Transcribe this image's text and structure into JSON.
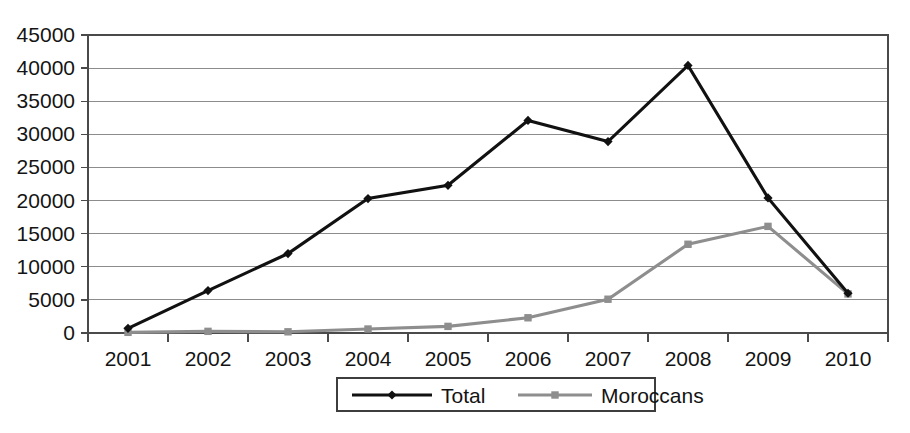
{
  "chart_data": {
    "type": "line",
    "title": "",
    "subtitle": "",
    "xlabel": "",
    "ylabel": "",
    "categories": [
      "2001",
      "2002",
      "2003",
      "2004",
      "2005",
      "2006",
      "2007",
      "2008",
      "2009",
      "2010"
    ],
    "series": [
      {
        "name": "Total",
        "color": "#111111",
        "marker": "diamond",
        "values": [
          700,
          6400,
          12000,
          20300,
          22300,
          32100,
          28900,
          40400,
          20400,
          6000
        ]
      },
      {
        "name": "Moroccans",
        "color": "#8e8e8e",
        "marker": "square",
        "values": [
          100,
          250,
          180,
          600,
          1000,
          2300,
          5100,
          13400,
          16100,
          5900
        ]
      }
    ],
    "ylim": [
      0,
      45000
    ],
    "yticks": [
      0,
      5000,
      10000,
      15000,
      20000,
      25000,
      30000,
      35000,
      40000,
      45000
    ],
    "ytick_labels": [
      "0",
      "5000",
      "10000",
      "15000",
      "20000",
      "25000",
      "30000",
      "35000",
      "40000",
      "45000"
    ],
    "grid": true,
    "grid_axis": "y",
    "legend_position": "bottom",
    "legend_entries": [
      "Total",
      "Moroccans"
    ]
  },
  "axes": {
    "y_axis_name": "y-axis",
    "x_axis_name": "x-axis"
  }
}
